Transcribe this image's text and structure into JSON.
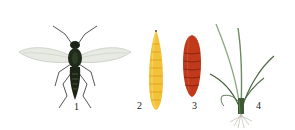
{
  "figures": [
    {
      "id": "fly",
      "label": "1"
    },
    {
      "id": "larva",
      "label": "2"
    },
    {
      "id": "pupa",
      "label": "3"
    },
    {
      "id": "plant",
      "label": "4"
    }
  ],
  "colors": {
    "background": "#ffffff",
    "fly_body": "#1c2418",
    "fly_wing": "#c9cfc4",
    "larva": "#f2c23a",
    "larva_segment": "#e6a820",
    "pupa": "#c0391a",
    "pupa_segment": "#8e2410",
    "plant_leaf": "#4f6b45",
    "plant_root": "#9a9a8a",
    "label_text": "#222222"
  }
}
